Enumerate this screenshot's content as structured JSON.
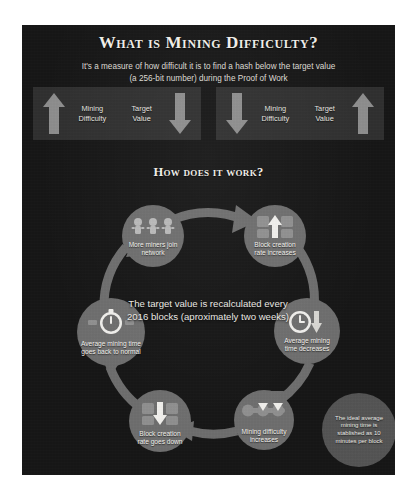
{
  "colors": {
    "panel_bg": "#161616",
    "compare_panel_bg": "#2f2f2f",
    "arrow": "#8d8d8d",
    "node": "#6e6e6e",
    "ring": "#6e6e6e",
    "note_bubble": "#545454",
    "text": "#f2f0ea"
  },
  "header": {
    "title": "What is Mining Difficulty?",
    "subtitle_line1": "It's a measure of how difficult it is to find a hash below the target value",
    "subtitle_line2": "(a 256-bit number) during the Proof of Work"
  },
  "comparison": {
    "left": {
      "start_arrow": "arrow-up",
      "label_1": "Mining\nDifficulty",
      "label_2": "Target\nValue",
      "end_arrow": "arrow-down"
    },
    "right": {
      "start_arrow": "arrow-down",
      "label_1": "Mining\nDifficulty",
      "label_2": "Target\nValue",
      "end_arrow": "arrow-up"
    }
  },
  "section": {
    "heading": "How does it work?"
  },
  "cycle": {
    "center_text": "The target value is recalculated every 2016 blocks (aproximately two weeks)",
    "side_note": "The ideal average mining time is stablished as 10 minutes per block",
    "nodes": [
      {
        "id": "miners",
        "label": "More miners join network",
        "icon": "miners-icon"
      },
      {
        "id": "rate_up",
        "label": "Block creation rate increases",
        "icon": "blocks-arrow-up-icon"
      },
      {
        "id": "time_down",
        "label": "Average mining time decreases",
        "icon": "clock-arrow-down-icon"
      },
      {
        "id": "diff_up",
        "label": "Mining difficulty increases",
        "icon": "difficulty-bar-icon"
      },
      {
        "id": "rate_down",
        "label": "Block creation rate goes down",
        "icon": "blocks-arrow-down-icon"
      },
      {
        "id": "time_norm",
        "label": "Average mining time goes back to normal",
        "icon": "stopwatch-icon"
      }
    ]
  }
}
